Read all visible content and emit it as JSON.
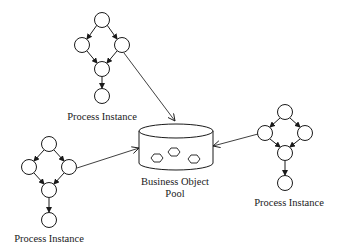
{
  "diagram": {
    "colors": {
      "stroke": "#1a1a1a",
      "fill": "#ffffff",
      "background": "#ffffff"
    },
    "processes": [
      {
        "id": "top",
        "label": "Process Instance"
      },
      {
        "id": "left",
        "label": "Process Instance"
      },
      {
        "id": "right",
        "label": "Process Instance"
      }
    ],
    "pool": {
      "label_line1": "Business Object",
      "label_line2": "Pool",
      "object_count": 3
    },
    "connections": [
      {
        "from": "top",
        "to": "pool"
      },
      {
        "from": "left",
        "to": "pool"
      },
      {
        "from": "right",
        "to": "pool"
      }
    ]
  }
}
